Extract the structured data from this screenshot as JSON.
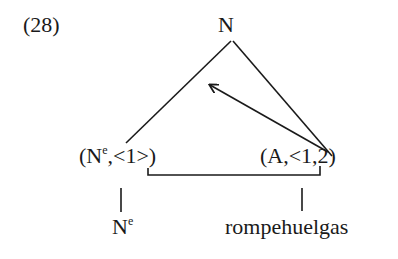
{
  "example_number": "(28)",
  "tree": {
    "root": {
      "label": "N"
    },
    "left_node": {
      "label_base": "(N",
      "label_sup": "e",
      "label_rest": ",<1>)"
    },
    "right_node": {
      "label": "(A,<1,2)"
    },
    "left_leaf": {
      "label_base": "N",
      "label_sup": "e"
    },
    "right_leaf": {
      "label": "rompehuelgas"
    }
  },
  "edges": [
    {
      "from": "root",
      "to": "left_node",
      "type": "line"
    },
    {
      "from": "root",
      "to": "right_node",
      "type": "line"
    },
    {
      "from": "right_node",
      "to": "root-area",
      "type": "arrow"
    },
    {
      "from": "left_node.arg1",
      "to": "right_node.arg1",
      "type": "bracket-link"
    },
    {
      "from": "left_node",
      "to": "left_leaf",
      "type": "line"
    },
    {
      "from": "right_node",
      "to": "right_leaf",
      "type": "line"
    }
  ]
}
